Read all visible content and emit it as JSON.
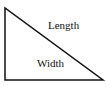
{
  "diagram": {
    "shape": "right-triangle",
    "stroke_color": "#111111",
    "fill_color": "#ffffff",
    "vertices": [
      [
        5,
        8
      ],
      [
        5,
        80
      ],
      [
        103,
        80
      ]
    ],
    "labels": {
      "hypotenuse": "Length",
      "interior": "Width"
    }
  }
}
